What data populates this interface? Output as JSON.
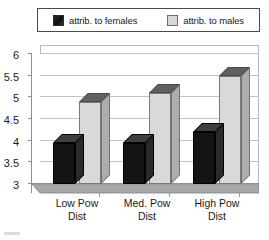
{
  "chart_data": {
    "type": "bar",
    "title": "",
    "subtitle": "",
    "xlabel": "",
    "ylabel": "",
    "categories": [
      "Low Pow Dist",
      "Med. Pow Dist",
      "High Pow Dist"
    ],
    "category_lines": [
      [
        "Low Pow",
        "Dist"
      ],
      [
        "Med. Pow",
        "Dist"
      ],
      [
        "High Pow",
        "Dist"
      ]
    ],
    "series": [
      {
        "name": "attrib. to females",
        "values": [
          3.95,
          3.95,
          4.2
        ],
        "color": "#141414"
      },
      {
        "name": "attrib. to males",
        "values": [
          4.9,
          5.1,
          5.5
        ],
        "color": "#d9d9d9"
      }
    ],
    "ylim": [
      3,
      6
    ],
    "yticks": [
      3,
      3.5,
      4,
      4.5,
      5,
      5.5,
      6
    ],
    "ytick_labels": [
      "3",
      "3.5",
      "4",
      "4.5",
      "5",
      "5.5",
      "6"
    ],
    "grid": true,
    "grid_axis": "y",
    "legend_position": "top",
    "style": "3d-column"
  },
  "legend": {
    "entries": [
      {
        "label": "attrib. to females",
        "swatch": "black-swatch"
      },
      {
        "label": "attrib. to males",
        "swatch": "grey-swatch"
      }
    ]
  }
}
